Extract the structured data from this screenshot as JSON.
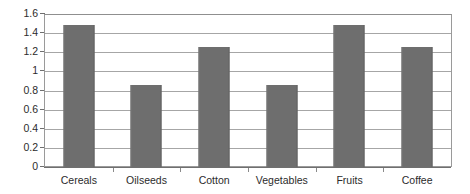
{
  "chart_data": {
    "type": "bar",
    "title": "",
    "subtitle": "",
    "xlabel": "",
    "ylabel": "",
    "categories": [
      "Cereals",
      "Oilseeds",
      "Cotton",
      "Vegetables",
      "Fruits",
      "Coffee"
    ],
    "values": [
      1.49,
      0.86,
      1.26,
      0.86,
      1.48,
      1.25
    ],
    "ylim": [
      0,
      1.6
    ],
    "ytick_step": 0.2,
    "ytick_labels": [
      "0",
      "0.2",
      "0.4",
      "0.6",
      "0.8",
      "1",
      "1.2",
      "1.4",
      "1.6"
    ],
    "ytick_values": [
      0,
      0.2,
      0.4,
      0.6,
      0.8,
      1,
      1.2,
      1.4,
      1.6
    ],
    "grid": true,
    "grid_axis": "y",
    "legend": false,
    "legend_position": "none",
    "bar_color": "#6e6e6e",
    "plot_border_color": "#9a9a9a",
    "gridline_color": "#a6a6a6",
    "background_color": "#ffffff",
    "annotations": []
  }
}
